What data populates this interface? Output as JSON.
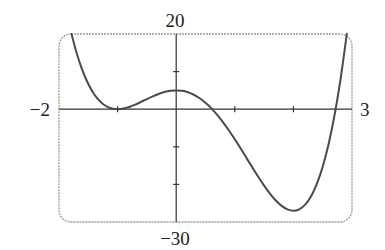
{
  "chart_data": {
    "type": "line",
    "title": "",
    "xlabel": "",
    "ylabel": "",
    "xlim": [
      -2,
      3
    ],
    "ylim": [
      -30,
      20
    ],
    "grid": false,
    "legend": null,
    "tick_labels": {
      "x_min": "−2",
      "x_max": "3",
      "y_max": "20",
      "y_min": "−30"
    },
    "x_ticks": [
      -1,
      1,
      2
    ],
    "y_ticks": [
      10,
      -10,
      -20
    ],
    "series": [
      {
        "name": "curve",
        "x": [
          -1.786,
          -1.7,
          -1.6,
          -1.5,
          -1.4,
          -1.3,
          -1.2,
          -1.1,
          -1.0,
          -0.9,
          -0.8,
          -0.7,
          -0.6,
          -0.5,
          -0.4,
          -0.3,
          -0.2,
          -0.1,
          0.0,
          0.1,
          0.2,
          0.3,
          0.4,
          0.5,
          0.6,
          0.7,
          0.8,
          0.9,
          1.0,
          1.1,
          1.2,
          1.3,
          1.4,
          1.5,
          1.6,
          1.7,
          1.8,
          1.9,
          2.0,
          2.1,
          2.2,
          2.3,
          2.4,
          2.5,
          2.6,
          2.7,
          2.8,
          2.9,
          2.9105
        ],
        "y": [
          20.0,
          15.03,
          10.33,
          6.69,
          3.98,
          2.08,
          0.85,
          0.2,
          0.0,
          0.16,
          0.6,
          1.21,
          1.93,
          2.69,
          3.41,
          4.05,
          4.56,
          4.88,
          5.0,
          4.88,
          4.49,
          3.84,
          2.9,
          1.69,
          0.21,
          -1.53,
          -3.5,
          -5.67,
          -8.0,
          -10.45,
          -12.97,
          -15.5,
          -17.97,
          -20.31,
          -22.44,
          -24.28,
          -25.72,
          -26.66,
          -27.0,
          -26.62,
          -25.4,
          -23.2,
          -19.88,
          -15.31,
          -9.33,
          -1.78,
          7.51,
          18.71,
          20.0
        ]
      }
    ]
  },
  "colors": {
    "curve": "#4a4a4a",
    "axes": "#333333",
    "frame": "#9a9a9a",
    "text": "#222222"
  }
}
